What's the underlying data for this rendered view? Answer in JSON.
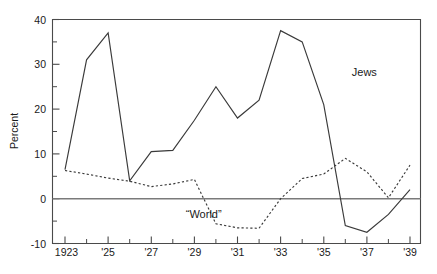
{
  "chart_data": {
    "type": "line",
    "title": "",
    "xlabel": "",
    "ylabel": "Percent",
    "xlim": [
      1923,
      1939
    ],
    "ylim": [
      -10,
      40
    ],
    "grid": false,
    "legend_position": "inline-annotation",
    "y_ticks_major": [
      40,
      30,
      20,
      10,
      0,
      -10
    ],
    "y_tick_labels": [
      "40",
      "30",
      "20",
      "10",
      "0",
      "-10"
    ],
    "y_ticks_minor": [
      35,
      25,
      15,
      5,
      -5
    ],
    "x_ticks_major": [
      1923,
      1925,
      1927,
      1929,
      1931,
      1933,
      1935,
      1937,
      1939
    ],
    "x_tick_labels": [
      "1923",
      "'25",
      "'27",
      "'29",
      "'31",
      "'33",
      "'35",
      "'37",
      "'39"
    ],
    "x_ticks_minor": [
      1924,
      1926,
      1928,
      1930,
      1932,
      1934,
      1936,
      1938
    ],
    "reference_line_y": 0,
    "x": [
      1923,
      1924,
      1925,
      1926,
      1927,
      1928,
      1929,
      1930,
      1931,
      1932,
      1933,
      1934,
      1935,
      1936,
      1937,
      1938,
      1939
    ],
    "series": [
      {
        "name": "Jews",
        "style": "solid",
        "label": "Jews",
        "label_x": 1936.3,
        "label_y": 27.5,
        "values": [
          6.5,
          31.0,
          37.0,
          4.0,
          10.5,
          10.8,
          17.5,
          25.0,
          18.0,
          22.0,
          37.5,
          35.0,
          21.0,
          -6.0,
          -7.5,
          -3.5,
          2.0
        ]
      },
      {
        "name": "“World”",
        "style": "dotted",
        "label": "“World”",
        "label_x": 1928.6,
        "label_y": -4.3,
        "values": [
          6.3,
          5.5,
          4.6,
          3.9,
          2.7,
          3.3,
          4.3,
          -5.6,
          -6.5,
          -6.6,
          0.0,
          4.5,
          5.5,
          9.0,
          6.0,
          0.2,
          7.5
        ]
      }
    ],
    "annotations": [
      {
        "name": "jews-series-label",
        "text": "Jews"
      },
      {
        "name": "world-series-label",
        "text": "“World”"
      }
    ]
  },
  "axis": {
    "y_title": "Percent"
  },
  "caption": {
    "text": ""
  }
}
